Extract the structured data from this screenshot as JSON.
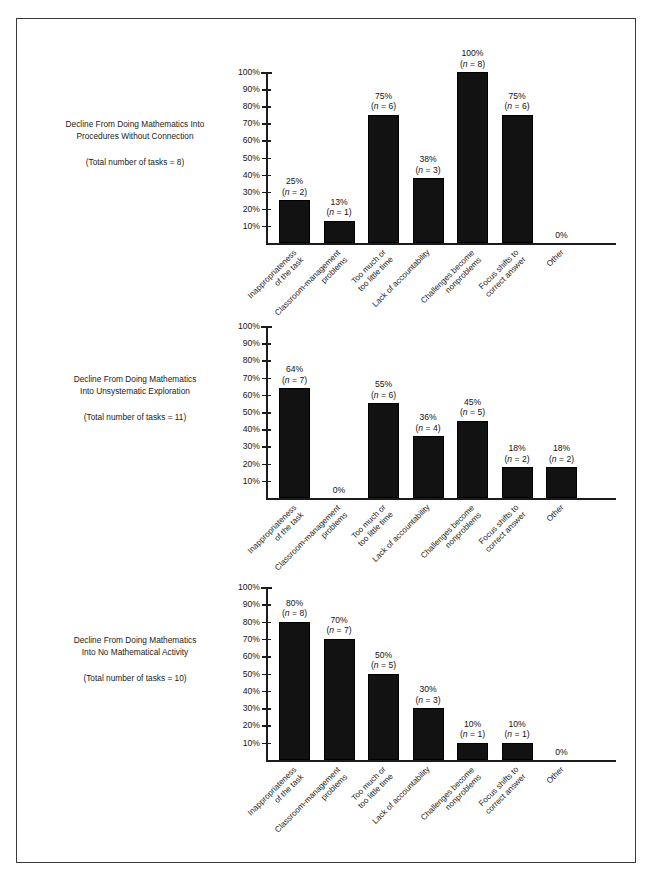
{
  "document": {
    "kind": "figure-page",
    "frame_border_color": "#3a3a3a",
    "bar_color": "#121212",
    "axis_color": "#1c1c1c"
  },
  "shared": {
    "categories": [
      [
        "Inappropriateness",
        "of the task"
      ],
      [
        "Classroom-management",
        "problems"
      ],
      [
        "Too much or",
        "too little time"
      ],
      [
        "Lack of accountability"
      ],
      [
        "Challenges become",
        "nonproblems"
      ],
      [
        "Focus shifts to",
        "correct answer"
      ],
      [
        "Other"
      ]
    ],
    "y_ticks": [
      "100%",
      "90%",
      "80%",
      "70%",
      "60%",
      "50%",
      "40%",
      "30%",
      "20%",
      "10%"
    ],
    "y_tick_values": [
      100,
      90,
      80,
      70,
      60,
      50,
      40,
      30,
      20,
      10
    ]
  },
  "charts": [
    {
      "caption": {
        "title_lines": [
          "Decline From Doing Mathematics Into",
          "Procedures Without Connection"
        ],
        "total": "(Total number of tasks = 8)"
      },
      "bars": [
        {
          "pct_label": "25%",
          "n_label": "(n = 2)",
          "value": 25,
          "n": 2
        },
        {
          "pct_label": "13%",
          "n_label": "(n = 1)",
          "value": 13,
          "n": 1
        },
        {
          "pct_label": "75%",
          "n_label": "(n = 6)",
          "value": 75,
          "n": 6
        },
        {
          "pct_label": "38%",
          "n_label": "(n = 3)",
          "value": 38,
          "n": 3
        },
        {
          "pct_label": "100%",
          "n_label": "(n = 8)",
          "value": 100,
          "n": 8
        },
        {
          "pct_label": "75%",
          "n_label": "(n = 6)",
          "value": 75,
          "n": 6
        },
        {
          "pct_label": "0%",
          "n_label": "",
          "value": 0,
          "n": 0
        }
      ]
    },
    {
      "caption": {
        "title_lines": [
          "Decline From Doing Mathematics",
          "Into Unsystematic Exploration"
        ],
        "total": "(Total number of tasks = 11)"
      },
      "bars": [
        {
          "pct_label": "64%",
          "n_label": "(n = 7)",
          "value": 64,
          "n": 7
        },
        {
          "pct_label": "0%",
          "n_label": "",
          "value": 0,
          "n": 0
        },
        {
          "pct_label": "55%",
          "n_label": "(n = 6)",
          "value": 55,
          "n": 6
        },
        {
          "pct_label": "36%",
          "n_label": "(n = 4)",
          "value": 36,
          "n": 4
        },
        {
          "pct_label": "45%",
          "n_label": "(n = 5)",
          "value": 45,
          "n": 5
        },
        {
          "pct_label": "18%",
          "n_label": "(n = 2)",
          "value": 18,
          "n": 2
        },
        {
          "pct_label": "18%",
          "n_label": "(n = 2)",
          "value": 18,
          "n": 2
        }
      ]
    },
    {
      "caption": {
        "title_lines": [
          "Decline From Doing Mathematics",
          "Into No Mathematical Activity"
        ],
        "total": "(Total number of tasks = 10)"
      },
      "bars": [
        {
          "pct_label": "80%",
          "n_label": "(n = 8)",
          "value": 80,
          "n": 8
        },
        {
          "pct_label": "70%",
          "n_label": "(n = 7)",
          "value": 70,
          "n": 7
        },
        {
          "pct_label": "50%",
          "n_label": "(n = 5)",
          "value": 50,
          "n": 5
        },
        {
          "pct_label": "30%",
          "n_label": "(n = 3)",
          "value": 30,
          "n": 3
        },
        {
          "pct_label": "10%",
          "n_label": "(n = 1)",
          "value": 10,
          "n": 1
        },
        {
          "pct_label": "10%",
          "n_label": "(n = 1)",
          "value": 10,
          "n": 1
        },
        {
          "pct_label": "0%",
          "n_label": "",
          "value": 0,
          "n": 0
        }
      ]
    }
  ],
  "chart_data": [
    {
      "type": "bar",
      "title": "Decline From Doing Mathematics Into Procedures Without Connection",
      "subtitle": "(Total number of tasks = 8)",
      "xlabel": "",
      "ylabel": "",
      "ylim": [
        0,
        100
      ],
      "yticks": [
        10,
        20,
        30,
        40,
        50,
        60,
        70,
        80,
        90,
        100
      ],
      "ytick_labels": [
        "10%",
        "20%",
        "30%",
        "40%",
        "50%",
        "60%",
        "70%",
        "80%",
        "90%",
        "100%"
      ],
      "grid": false,
      "legend": "none",
      "categories": [
        "Inappropriateness of the task",
        "Classroom-management problems",
        "Too much or too little time",
        "Lack of accountability",
        "Challenges become nonproblems",
        "Focus shifts to correct answer",
        "Other"
      ],
      "values": [
        25,
        13,
        75,
        38,
        100,
        75,
        0
      ],
      "counts": [
        2,
        1,
        6,
        3,
        8,
        6,
        0
      ],
      "data_labels": [
        "25% (n = 2)",
        "13% (n = 1)",
        "75% (n = 6)",
        "38% (n = 3)",
        "100% (n = 8)",
        "75% (n = 6)",
        "0%"
      ]
    },
    {
      "type": "bar",
      "title": "Decline From Doing Mathematics Into Unsystematic Exploration",
      "subtitle": "(Total number of tasks = 11)",
      "xlabel": "",
      "ylabel": "",
      "ylim": [
        0,
        100
      ],
      "yticks": [
        10,
        20,
        30,
        40,
        50,
        60,
        70,
        80,
        90,
        100
      ],
      "ytick_labels": [
        "10%",
        "20%",
        "30%",
        "40%",
        "50%",
        "60%",
        "70%",
        "80%",
        "90%",
        "100%"
      ],
      "grid": false,
      "legend": "none",
      "categories": [
        "Inappropriateness of the task",
        "Classroom-management problems",
        "Too much or too little time",
        "Lack of accountability",
        "Challenges become nonproblems",
        "Focus shifts to correct answer",
        "Other"
      ],
      "values": [
        64,
        0,
        55,
        36,
        45,
        18,
        18
      ],
      "counts": [
        7,
        0,
        6,
        4,
        5,
        2,
        2
      ],
      "data_labels": [
        "64% (n = 7)",
        "0%",
        "55% (n = 6)",
        "36% (n = 4)",
        "45% (n = 5)",
        "18% (n = 2)",
        "18% (n = 2)"
      ]
    },
    {
      "type": "bar",
      "title": "Decline From Doing Mathematics Into No Mathematical Activity",
      "subtitle": "(Total number of tasks = 10)",
      "xlabel": "",
      "ylabel": "",
      "ylim": [
        0,
        100
      ],
      "yticks": [
        10,
        20,
        30,
        40,
        50,
        60,
        70,
        80,
        90,
        100
      ],
      "ytick_labels": [
        "10%",
        "20%",
        "30%",
        "40%",
        "50%",
        "60%",
        "70%",
        "80%",
        "90%",
        "100%"
      ],
      "grid": false,
      "legend": "none",
      "categories": [
        "Inappropriateness of the task",
        "Classroom-management problems",
        "Too much or too little time",
        "Lack of accountability",
        "Challenges become nonproblems",
        "Focus shifts to correct answer",
        "Other"
      ],
      "values": [
        80,
        70,
        50,
        30,
        10,
        10,
        0
      ],
      "counts": [
        8,
        7,
        5,
        3,
        1,
        1,
        0
      ],
      "data_labels": [
        "80% (n = 8)",
        "70% (n = 7)",
        "50% (n = 5)",
        "30% (n = 3)",
        "10% (n = 1)",
        "10% (n = 1)",
        "0%"
      ]
    }
  ]
}
